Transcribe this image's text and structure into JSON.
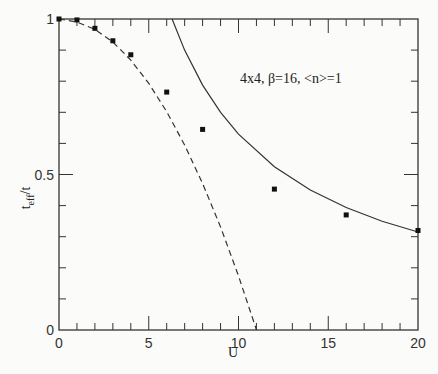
{
  "chart_data": {
    "type": "line",
    "title": "",
    "annotation": "4x4,  β=16,  <n>=1",
    "xlabel": "U",
    "ylabel": "t_eff/t",
    "xlim": [
      0,
      20
    ],
    "ylim": [
      0,
      1
    ],
    "x_ticks": [
      "0",
      "5",
      "10",
      "15",
      "20"
    ],
    "y_ticks": [
      "0",
      "0.5",
      "1"
    ],
    "grid": false,
    "legend": null,
    "series": [
      {
        "name": "data points",
        "style": "square-markers",
        "x": [
          0,
          1,
          2,
          3,
          4,
          6,
          8,
          12,
          16,
          20
        ],
        "y": [
          1.0,
          0.997,
          0.97,
          0.93,
          0.885,
          0.765,
          0.645,
          0.453,
          0.37,
          0.32
        ]
      },
      {
        "name": "dashed curve (small-U)",
        "style": "dashed",
        "x": [
          0,
          1,
          2,
          3,
          4,
          5,
          6,
          7,
          8,
          9,
          10,
          11
        ],
        "y": [
          1.0,
          0.99,
          0.967,
          0.926,
          0.868,
          0.793,
          0.702,
          0.595,
          0.471,
          0.331,
          0.174,
          0.0
        ]
      },
      {
        "name": "solid curve (large-U)",
        "style": "solid",
        "x": [
          6.3,
          7,
          8,
          9,
          10,
          12,
          14,
          16,
          18,
          20
        ],
        "y": [
          1.0,
          0.9,
          0.7875,
          0.7,
          0.63,
          0.525,
          0.45,
          0.394,
          0.35,
          0.315
        ]
      }
    ]
  },
  "labels": {
    "x_axis": "U",
    "y_axis_main": "t",
    "y_axis_sub": "eff",
    "y_axis_tail": "/t",
    "annotation": "4x4,  β=16,  <n>=1"
  }
}
